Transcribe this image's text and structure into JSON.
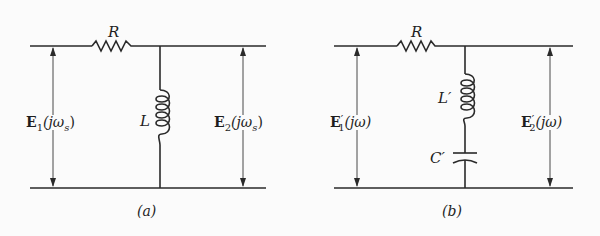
{
  "figure": {
    "panels": [
      {
        "id": "a",
        "caption": "(a)",
        "resistor_label": "R",
        "inductor_label": "L",
        "input_voltage": {
          "symbol": "E",
          "sub": "1",
          "prime": "",
          "arg": "(jω",
          "arg_sub": "s",
          "close": ")"
        },
        "output_voltage": {
          "symbol": "E",
          "sub": "2",
          "prime": "",
          "arg": "(jω",
          "arg_sub": "s",
          "close": ")"
        }
      },
      {
        "id": "b",
        "caption": "(b)",
        "resistor_label": "R",
        "inductor_label": "L′",
        "capacitor_label": "C′",
        "input_voltage": {
          "symbol": "E",
          "sub": "1",
          "prime": "′",
          "arg": "(jω)"
        },
        "output_voltage": {
          "symbol": "E",
          "sub": "2",
          "prime": "′",
          "arg": "(jω)"
        }
      }
    ]
  }
}
